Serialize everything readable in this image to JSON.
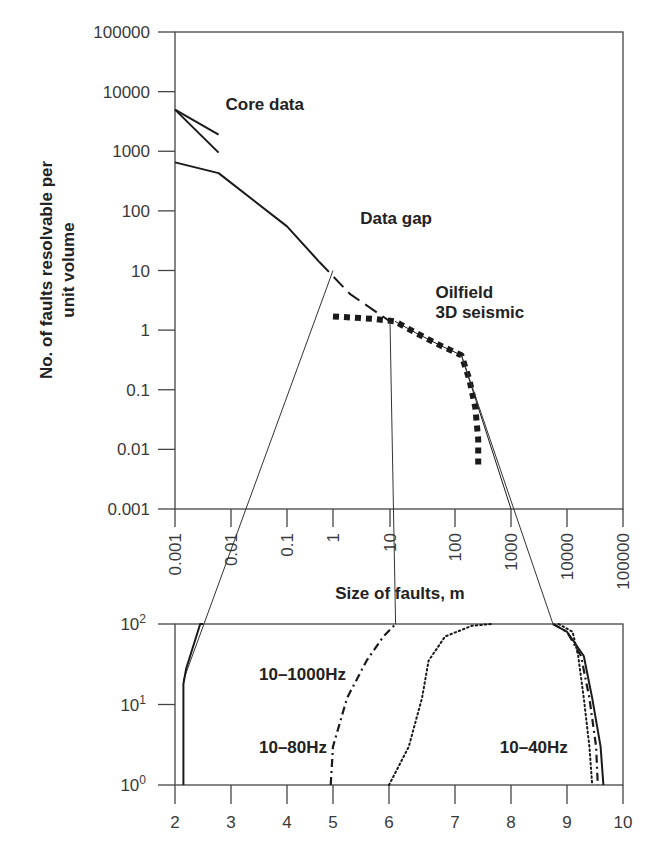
{
  "chart_data": [
    {
      "id": "upper",
      "type": "line",
      "xscale": "log",
      "yscale": "log",
      "xlabel": "Size of faults, m",
      "ylabel": [
        "No. of faults resolvable per",
        "unit volume"
      ],
      "xlim": [
        0.001,
        100000
      ],
      "ylim": [
        0.001,
        100000
      ],
      "x_ticks": [
        "0.001",
        "0.01",
        "0.1",
        "1",
        "10",
        "100",
        "1000",
        "10000",
        "100000"
      ],
      "y_ticks": [
        "100000",
        "10000",
        "1000",
        "100",
        "10",
        "1",
        "0.1",
        "0.01",
        "0.001"
      ],
      "grid": false,
      "annotations": [
        {
          "text": "Core data",
          "x": 0.008,
          "y": 5000
        },
        {
          "text": "Data gap",
          "x": 3,
          "y": 60
        },
        {
          "text": "Oilfield",
          "x": 50,
          "y": 3.5
        },
        {
          "text": "3D seismic",
          "x": 50,
          "y": 1.6
        }
      ],
      "series": [
        {
          "name": "Core data upper",
          "style": "solid",
          "x": [
            0.001,
            0.006
          ],
          "y": [
            5000,
            1900
          ]
        },
        {
          "name": "Core data lower",
          "style": "solid",
          "x": [
            0.001,
            0.006
          ],
          "y": [
            5000,
            950
          ]
        },
        {
          "name": "Main trend",
          "style": "solid",
          "x": [
            0.001,
            0.006,
            0.1,
            0.5
          ],
          "y": [
            650,
            430,
            55,
            14
          ]
        },
        {
          "name": "Data gap extrapolation",
          "style": "dashed",
          "x": [
            0.5,
            2,
            10
          ],
          "y": [
            14,
            4,
            1.4
          ]
        },
        {
          "name": "Oilfield 3D seismic",
          "style": "dotted-thick",
          "x": [
            1,
            5,
            12,
            25,
            60,
            130,
            180,
            230,
            260,
            260
          ],
          "y": [
            1.7,
            1.55,
            1.4,
            0.9,
            0.55,
            0.38,
            0.15,
            0.05,
            0.015,
            0.005
          ]
        },
        {
          "name": "Seismic fit",
          "style": "solid-thin",
          "x": [
            12,
            25,
            60,
            130,
            1000
          ],
          "y": [
            1.4,
            0.9,
            0.55,
            0.38,
            0.001
          ]
        }
      ],
      "connectors": [
        {
          "from": {
            "x": 1,
            "y": 10
          },
          "to_lower": {
            "x": 2.15,
            "y": 20
          }
        },
        {
          "from": {
            "x": 10,
            "y": 1.4
          },
          "to_lower": {
            "x": 6.1,
            "y": 100
          }
        },
        {
          "from": {
            "x": 130,
            "y": 0.38
          },
          "to_lower": {
            "x": 8.75,
            "y": 100
          }
        }
      ]
    },
    {
      "id": "lower",
      "type": "line",
      "xscale": "linear",
      "yscale": "log",
      "xlim": [
        2,
        10
      ],
      "ylim": [
        1,
        100
      ],
      "x_ticks": [
        "2",
        "3",
        "4",
        "5",
        "6",
        "7",
        "8",
        "9",
        "10"
      ],
      "y_ticks": [
        {
          "base": "10",
          "exp": "2"
        },
        {
          "base": "10",
          "exp": "1"
        },
        {
          "base": "10",
          "exp": "0"
        }
      ],
      "grid": false,
      "annotations": [
        {
          "text": "10–1000Hz",
          "x": 3.5,
          "y": 20
        },
        {
          "text": "10–80Hz",
          "x": 3.5,
          "y": 2.5
        },
        {
          "text": "10–40Hz",
          "x": 7.8,
          "y": 2.5
        }
      ],
      "series": [
        {
          "name": "10–1000Hz",
          "style": "solid",
          "x": [
            2.15,
            2.15,
            2.2,
            2.45,
            2.5
          ],
          "y": [
            1,
            18,
            28,
            100,
            100
          ]
        },
        {
          "name": "10–80Hz",
          "style": "dashdot",
          "x": [
            4.95,
            5.0,
            5.25,
            5.6,
            5.9,
            6.1
          ],
          "y": [
            1,
            3,
            12,
            35,
            70,
            100
          ]
        },
        {
          "name": "10–40Hz",
          "style": "dotted",
          "x": [
            6.0,
            6.3,
            6.5,
            6.6,
            6.85,
            7.3,
            7.65
          ],
          "y": [
            1,
            3,
            12,
            35,
            70,
            95,
            100
          ]
        },
        {
          "name": "Right solid",
          "style": "solid",
          "x": [
            8.75,
            9.0,
            9.3,
            9.45,
            9.6,
            9.65
          ],
          "y": [
            100,
            80,
            40,
            12,
            3,
            1
          ]
        },
        {
          "name": "Right dashdot",
          "style": "dashdot",
          "x": [
            8.75,
            9.0,
            9.25,
            9.4,
            9.52,
            9.55
          ],
          "y": [
            100,
            80,
            40,
            12,
            3,
            1
          ]
        },
        {
          "name": "Right dotted",
          "style": "dotted",
          "x": [
            8.85,
            9.1,
            9.2,
            9.3,
            9.4,
            9.45
          ],
          "y": [
            100,
            80,
            40,
            12,
            3,
            1
          ]
        }
      ]
    }
  ]
}
